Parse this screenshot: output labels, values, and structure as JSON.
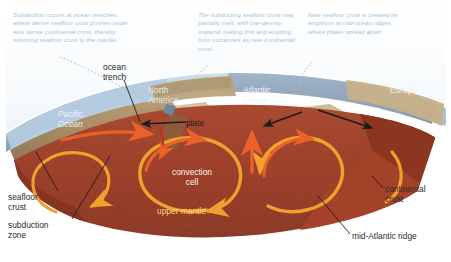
{
  "figure": {
    "colors": {
      "mantle_red": "#9e3b23",
      "mantle_red_dark": "#8a3320",
      "ocean_blue": "#8fa3bd",
      "pacific_blue": "#b9cede",
      "sky_white": "#ffffff",
      "continental_tan": "#c9b78e",
      "crust_brown": "#9c7c56",
      "arrow_orange": "#f0a02c",
      "arrow_red_orange": "#e8622a",
      "annotation_blue": "#9fc4de",
      "label_dark": "#2b2b2b",
      "label_light": "#f2f2f2"
    }
  },
  "annotations": {
    "subduction": "Subduction occurs at ocean trenches, where dense seafloor crust pushes under less dense continental crust, thereby returning seafloor crust to the mantle.",
    "melting": "The subducting seafloor crust may partially melt, with low-density material melting first and erupting from volcanoes as new continental crust.",
    "new_crust": "New seafloor crust is created by eruptions at mid-ocean ridges, where plates spread apart."
  },
  "labels": {
    "ocean_trench": "ocean\ntrench",
    "north_america": "North\nAmerica",
    "pacific_ocean": "Pacific\nOcean",
    "atlantic_ocean": "Atlantic\nOcean",
    "europe": "Europe",
    "plate": "plate",
    "convection_cell": "convection\ncell",
    "upper_mantle": "upper mantle",
    "seafloor_crust": "seafloor\ncrust",
    "subduction_zone": "subduction\nzone",
    "continental_crust": "continental\ncrust",
    "mid_atlantic_ridge": "mid-Atlantic ridge"
  }
}
